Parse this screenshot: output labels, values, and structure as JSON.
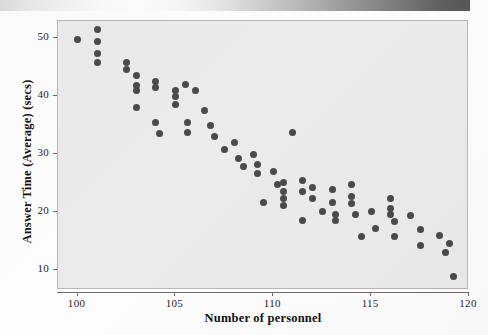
{
  "figure": {
    "scan_strip": "gradient-strip",
    "plot_background": "#eceaea",
    "point_color": "#4a4a4a"
  },
  "chart_data": {
    "type": "scatter",
    "title": "",
    "xlabel": "Number of personnel",
    "ylabel": "Answer Time (Average) (secs)",
    "xlim": [
      99.0,
      120.0
    ],
    "ylim": [
      6.5,
      53.0
    ],
    "xticks": [
      100,
      105,
      110,
      115,
      120
    ],
    "yticks": [
      10,
      20,
      30,
      40,
      50
    ],
    "grid": false,
    "legend": null,
    "marker": "filled-circle",
    "points": [
      [
        100.0,
        49.8
      ],
      [
        101.0,
        51.5
      ],
      [
        101.0,
        49.5
      ],
      [
        101.0,
        47.3
      ],
      [
        101.0,
        45.8
      ],
      [
        102.5,
        45.9
      ],
      [
        102.5,
        44.6
      ],
      [
        103.0,
        43.6
      ],
      [
        103.0,
        41.9
      ],
      [
        103.0,
        41.0
      ],
      [
        103.0,
        38.0
      ],
      [
        104.0,
        42.6
      ],
      [
        104.0,
        41.5
      ],
      [
        104.0,
        35.5
      ],
      [
        104.2,
        33.5
      ],
      [
        105.0,
        41.0
      ],
      [
        105.0,
        40.0
      ],
      [
        105.0,
        38.6
      ],
      [
        105.5,
        42.0
      ],
      [
        105.6,
        35.5
      ],
      [
        105.6,
        33.7
      ],
      [
        106.0,
        41.0
      ],
      [
        106.5,
        37.5
      ],
      [
        106.8,
        34.9
      ],
      [
        107.0,
        33.0
      ],
      [
        107.5,
        30.8
      ],
      [
        108.0,
        32.0
      ],
      [
        108.2,
        29.3
      ],
      [
        108.5,
        27.8
      ],
      [
        109.0,
        30.0
      ],
      [
        109.2,
        28.2
      ],
      [
        109.2,
        26.6
      ],
      [
        109.5,
        21.6
      ],
      [
        110.0,
        27.0
      ],
      [
        110.2,
        24.8
      ],
      [
        110.5,
        25.0
      ],
      [
        110.5,
        23.6
      ],
      [
        110.5,
        22.3
      ],
      [
        110.5,
        21.1
      ],
      [
        111.0,
        33.7
      ],
      [
        111.5,
        25.5
      ],
      [
        111.5,
        23.5
      ],
      [
        111.5,
        18.5
      ],
      [
        112.0,
        24.3
      ],
      [
        112.0,
        22.4
      ],
      [
        112.5,
        20.0
      ],
      [
        113.0,
        23.8
      ],
      [
        113.0,
        21.6
      ],
      [
        113.2,
        19.6
      ],
      [
        113.2,
        18.6
      ],
      [
        114.0,
        24.7
      ],
      [
        114.0,
        22.6
      ],
      [
        114.0,
        21.4
      ],
      [
        114.2,
        19.5
      ],
      [
        114.5,
        15.8
      ],
      [
        115.0,
        20.0
      ],
      [
        115.2,
        17.2
      ],
      [
        116.0,
        22.4
      ],
      [
        116.0,
        20.6
      ],
      [
        116.0,
        19.6
      ],
      [
        116.2,
        18.4
      ],
      [
        116.2,
        15.8
      ],
      [
        117.0,
        19.3
      ],
      [
        117.5,
        17.0
      ],
      [
        117.5,
        14.2
      ],
      [
        118.5,
        16.0
      ],
      [
        118.8,
        13.0
      ],
      [
        119.0,
        14.5
      ],
      [
        119.2,
        8.8
      ]
    ]
  },
  "axis": {
    "x_tick_labels": [
      "100",
      "105",
      "110",
      "115",
      "120"
    ],
    "y_tick_labels": [
      "10",
      "20",
      "30",
      "40",
      "50"
    ]
  }
}
